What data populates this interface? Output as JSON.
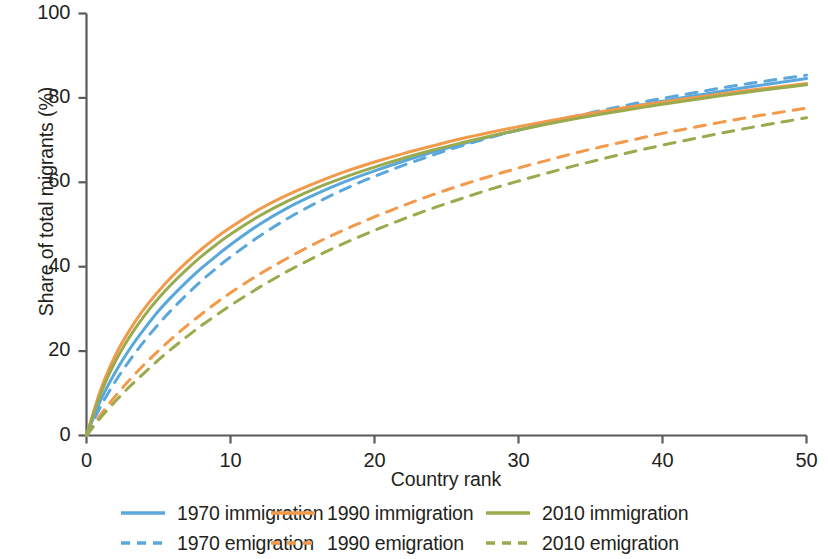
{
  "chart_data": {
    "type": "line",
    "title": "",
    "xlabel": "Country rank",
    "ylabel": "Share of total migrants (%)",
    "xlim": [
      0,
      50
    ],
    "ylim": [
      0,
      100
    ],
    "xticks": [
      0,
      10,
      20,
      30,
      40,
      50
    ],
    "yticks": [
      0,
      20,
      40,
      60,
      80,
      100
    ],
    "grid": false,
    "legend_position": "below-axes",
    "legend_columns": 3,
    "legend_rows": 2,
    "x": [
      0,
      1,
      2,
      3,
      4,
      5,
      6,
      7,
      8,
      9,
      10,
      12,
      14,
      16,
      18,
      20,
      22,
      24,
      26,
      28,
      30,
      32,
      34,
      36,
      38,
      40,
      42,
      44,
      46,
      48,
      50
    ],
    "series": [
      {
        "name": "1970 immigration",
        "label": "1970 immigration",
        "color": "#5aa7dc",
        "style": "solid",
        "values": [
          0,
          8.5,
          15.0,
          20.5,
          25.2,
          29.5,
          33.2,
          36.6,
          39.7,
          42.5,
          45.2,
          50.0,
          54.0,
          57.3,
          60.2,
          62.7,
          65.0,
          67.1,
          69.0,
          70.8,
          72.4,
          73.9,
          75.3,
          76.7,
          78.0,
          79.2,
          80.4,
          81.5,
          82.6,
          83.6,
          84.6
        ]
      },
      {
        "name": "1990 immigration",
        "label": "1990 immigration",
        "color": "#f2994a",
        "style": "solid",
        "values": [
          0,
          11.0,
          19.0,
          25.0,
          30.0,
          34.2,
          37.9,
          41.2,
          44.2,
          46.9,
          49.3,
          53.6,
          57.1,
          60.0,
          62.6,
          64.8,
          66.8,
          68.6,
          70.3,
          71.8,
          73.2,
          74.5,
          75.7,
          76.9,
          78.0,
          79.0,
          80.0,
          80.9,
          81.8,
          82.6,
          83.4
        ]
      },
      {
        "name": "2010 immigration",
        "label": "2010 immigration",
        "color": "#9aab4e",
        "style": "solid",
        "values": [
          0,
          10.0,
          17.5,
          23.4,
          28.3,
          32.5,
          36.2,
          39.5,
          42.5,
          45.2,
          47.7,
          52.0,
          55.6,
          58.7,
          61.3,
          63.6,
          65.7,
          67.6,
          69.3,
          70.9,
          72.4,
          73.8,
          75.1,
          76.3,
          77.4,
          78.5,
          79.5,
          80.5,
          81.4,
          82.3,
          83.1
        ]
      },
      {
        "name": "1970 emigration",
        "label": "1970 emigration",
        "color": "#5aa7dc",
        "style": "dashed",
        "values": [
          0,
          7.0,
          12.8,
          17.8,
          22.3,
          26.4,
          30.1,
          33.5,
          36.7,
          39.6,
          42.3,
          47.2,
          51.5,
          55.2,
          58.5,
          61.4,
          64.0,
          66.4,
          68.6,
          70.6,
          72.4,
          74.1,
          75.7,
          77.2,
          78.6,
          79.9,
          81.1,
          82.3,
          83.4,
          84.4,
          85.4
        ]
      },
      {
        "name": "1990 emigration",
        "label": "1990 emigration",
        "color": "#f2994a",
        "style": "dashed",
        "values": [
          0,
          5.0,
          9.3,
          13.2,
          16.8,
          20.1,
          23.2,
          26.1,
          28.8,
          31.4,
          33.8,
          38.2,
          42.1,
          45.7,
          48.9,
          51.8,
          54.5,
          57.0,
          59.3,
          61.4,
          63.4,
          65.2,
          67.0,
          68.6,
          70.1,
          71.6,
          72.9,
          74.2,
          75.4,
          76.5,
          77.6
        ]
      },
      {
        "name": "2010 emigration",
        "label": "2010 emigration",
        "color": "#9aab4e",
        "style": "dashed",
        "values": [
          0,
          4.3,
          8.1,
          11.6,
          14.8,
          17.9,
          20.8,
          23.5,
          26.1,
          28.5,
          30.8,
          35.1,
          39.0,
          42.5,
          45.7,
          48.6,
          51.3,
          53.8,
          56.1,
          58.3,
          60.3,
          62.2,
          64.0,
          65.7,
          67.3,
          68.8,
          70.2,
          71.6,
          72.9,
          74.1,
          75.3
        ]
      }
    ]
  },
  "axes": {
    "xlabel": "Country rank",
    "ylabel": "Share of total migrants (%)",
    "xtick_labels": [
      "0",
      "10",
      "20",
      "30",
      "40",
      "50"
    ],
    "ytick_labels": [
      "0",
      "20",
      "40",
      "60",
      "80",
      "100"
    ]
  },
  "legend": {
    "entries": [
      {
        "label": "1970 immigration",
        "color": "#5aa7dc",
        "style": "solid"
      },
      {
        "label": "1990 immigration",
        "color": "#f2994a",
        "style": "solid"
      },
      {
        "label": "2010 immigration",
        "color": "#9aab4e",
        "style": "solid"
      },
      {
        "label": "1970 emigration",
        "color": "#5aa7dc",
        "style": "dashed"
      },
      {
        "label": "1990 emigration",
        "color": "#f2994a",
        "style": "dashed"
      },
      {
        "label": "2010 emigration",
        "color": "#9aab4e",
        "style": "dashed"
      }
    ]
  },
  "colors": {
    "blue": "#5aa7dc",
    "orange": "#f2994a",
    "green": "#9aab4e",
    "axis": "#58595b",
    "text": "#231f20",
    "background": "#ffffff"
  }
}
